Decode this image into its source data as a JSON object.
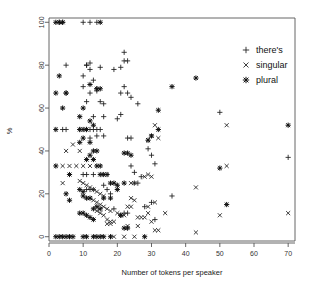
{
  "chart_data": {
    "type": "scatter",
    "title": "",
    "xlabel": "Number of tokens per speaker",
    "ylabel": "%",
    "xlim": [
      0,
      72
    ],
    "ylim": [
      -2,
      102
    ],
    "xticks": [
      0,
      10,
      20,
      30,
      40,
      50,
      60,
      70
    ],
    "yticks": [
      0,
      20,
      40,
      60,
      80,
      100
    ],
    "grid": false,
    "legend_position": "top-right",
    "series": [
      {
        "name": "there's",
        "marker": "plus",
        "points": [
          [
            3,
            100
          ],
          [
            4,
            100
          ],
          [
            10,
            100
          ],
          [
            12,
            100
          ],
          [
            14,
            100
          ],
          [
            22,
            86
          ],
          [
            23,
            82
          ],
          [
            22,
            82
          ],
          [
            21,
            79
          ],
          [
            15,
            79
          ],
          [
            12,
            81
          ],
          [
            11,
            80
          ],
          [
            5,
            80
          ],
          [
            11,
            80
          ],
          [
            12,
            78
          ],
          [
            19,
            78
          ],
          [
            10,
            75
          ],
          [
            13,
            73
          ],
          [
            22,
            70
          ],
          [
            10,
            70
          ],
          [
            12,
            67
          ],
          [
            5,
            67
          ],
          [
            21,
            67
          ],
          [
            14,
            69
          ],
          [
            23,
            67
          ],
          [
            24,
            65
          ],
          [
            14,
            68
          ],
          [
            11,
            63
          ],
          [
            15,
            63
          ],
          [
            26,
            62
          ],
          [
            16,
            62
          ],
          [
            21,
            57
          ],
          [
            20,
            55
          ],
          [
            13,
            56
          ],
          [
            16,
            56
          ],
          [
            5,
            50
          ],
          [
            9,
            50
          ],
          [
            11,
            50
          ],
          [
            12,
            50
          ],
          [
            13,
            50
          ],
          [
            14,
            50
          ],
          [
            15,
            50
          ],
          [
            4,
            50
          ],
          [
            14,
            47
          ],
          [
            16,
            47
          ],
          [
            12,
            46
          ],
          [
            23,
            46
          ],
          [
            24,
            46
          ],
          [
            29,
            41
          ],
          [
            30,
            38
          ],
          [
            31,
            34
          ],
          [
            10,
            29
          ],
          [
            11,
            29
          ],
          [
            13,
            29
          ],
          [
            24,
            33
          ],
          [
            25,
            30
          ],
          [
            27,
            28
          ],
          [
            26,
            25
          ],
          [
            25,
            25
          ],
          [
            36,
            19
          ],
          [
            18,
            20
          ],
          [
            17,
            22
          ],
          [
            16,
            24
          ],
          [
            13,
            22
          ],
          [
            12,
            22
          ],
          [
            11,
            22
          ],
          [
            28,
            14
          ],
          [
            30,
            16
          ],
          [
            22,
            11
          ],
          [
            21,
            10
          ],
          [
            50,
            58
          ],
          [
            70,
            37
          ],
          [
            23,
            11
          ],
          [
            31,
            8
          ],
          [
            19,
            13
          ]
        ]
      },
      {
        "name": "singular",
        "marker": "cross",
        "points": [
          [
            5,
            40
          ],
          [
            7,
            43
          ],
          [
            9,
            40
          ],
          [
            4,
            33
          ],
          [
            6,
            33
          ],
          [
            8,
            33
          ],
          [
            10,
            33
          ],
          [
            12,
            33
          ],
          [
            4,
            25
          ],
          [
            9,
            26
          ],
          [
            10,
            25
          ],
          [
            11,
            24
          ],
          [
            12,
            23
          ],
          [
            13,
            22
          ],
          [
            14,
            21
          ],
          [
            15,
            20
          ],
          [
            16,
            19
          ],
          [
            12,
            18
          ],
          [
            13,
            17
          ],
          [
            14,
            16
          ],
          [
            15,
            15
          ],
          [
            16,
            14
          ],
          [
            17,
            13
          ],
          [
            18,
            12
          ],
          [
            14,
            12
          ],
          [
            15,
            11
          ],
          [
            16,
            10
          ],
          [
            17,
            8
          ],
          [
            18,
            7
          ],
          [
            19,
            7
          ],
          [
            20,
            11
          ],
          [
            21,
            10
          ],
          [
            22,
            10
          ],
          [
            23,
            14
          ],
          [
            24,
            14
          ],
          [
            24,
            18
          ],
          [
            25,
            17
          ],
          [
            24,
            25
          ],
          [
            25,
            25
          ],
          [
            26,
            9
          ],
          [
            27,
            9
          ],
          [
            28,
            9
          ],
          [
            29,
            14
          ],
          [
            29,
            11
          ],
          [
            30,
            7
          ],
          [
            30,
            28
          ],
          [
            29,
            29
          ],
          [
            28,
            28
          ],
          [
            31,
            52
          ],
          [
            32,
            46
          ],
          [
            30,
            47
          ],
          [
            29,
            45
          ],
          [
            31,
            3
          ],
          [
            32,
            3
          ],
          [
            34,
            11
          ],
          [
            43,
            23
          ],
          [
            43,
            2
          ],
          [
            50,
            10
          ],
          [
            52,
            33
          ],
          [
            52,
            52
          ],
          [
            70,
            11
          ],
          [
            19,
            0
          ],
          [
            22,
            0
          ],
          [
            25,
            0
          ],
          [
            31,
            16
          ],
          [
            26,
            5
          ],
          [
            23,
            5
          ],
          [
            18,
            6
          ],
          [
            17,
            6
          ]
        ]
      },
      {
        "name": "plural",
        "marker": "asterisk",
        "points": [
          [
            2,
            100
          ],
          [
            3,
            100
          ],
          [
            4,
            100
          ],
          [
            15,
            100
          ],
          [
            3,
            75
          ],
          [
            2,
            67
          ],
          [
            5,
            67
          ],
          [
            4,
            60
          ],
          [
            10,
            60
          ],
          [
            2,
            50
          ],
          [
            9,
            50
          ],
          [
            10,
            50
          ],
          [
            9,
            56
          ],
          [
            12,
            54
          ],
          [
            13,
            52
          ],
          [
            11,
            50
          ],
          [
            10,
            46
          ],
          [
            12,
            44
          ],
          [
            9,
            44
          ],
          [
            13,
            40
          ],
          [
            14,
            40
          ],
          [
            12,
            38
          ],
          [
            13,
            36
          ],
          [
            11,
            36
          ],
          [
            14,
            33
          ],
          [
            15,
            33
          ],
          [
            6,
            29
          ],
          [
            2,
            33
          ],
          [
            5,
            20
          ],
          [
            6,
            17
          ],
          [
            9,
            22
          ],
          [
            10,
            21
          ],
          [
            10,
            19
          ],
          [
            11,
            18
          ],
          [
            12,
            18
          ],
          [
            13,
            13
          ],
          [
            14,
            14
          ],
          [
            15,
            13
          ],
          [
            16,
            18
          ],
          [
            9,
            11
          ],
          [
            10,
            11
          ],
          [
            11,
            10
          ],
          [
            12,
            9
          ],
          [
            13,
            8
          ],
          [
            18,
            25
          ],
          [
            19,
            25
          ],
          [
            20,
            24
          ],
          [
            22,
            39
          ],
          [
            23,
            39
          ],
          [
            24,
            38
          ],
          [
            15,
            29
          ],
          [
            16,
            29
          ],
          [
            17,
            29
          ],
          [
            18,
            18
          ],
          [
            20,
            22
          ],
          [
            22,
            25
          ],
          [
            22,
            4
          ],
          [
            23,
            4
          ],
          [
            29,
            45
          ],
          [
            30,
            47
          ],
          [
            32,
            50
          ],
          [
            32,
            59
          ],
          [
            36,
            70
          ],
          [
            43,
            74
          ],
          [
            50,
            32
          ],
          [
            52,
            15
          ],
          [
            70,
            52
          ],
          [
            14,
            69
          ],
          [
            12,
            71
          ],
          [
            15,
            69
          ],
          [
            2,
            0
          ],
          [
            3,
            0
          ],
          [
            4,
            0
          ],
          [
            5,
            0
          ],
          [
            6,
            0
          ],
          [
            7,
            0
          ],
          [
            10,
            0
          ],
          [
            11,
            0
          ],
          [
            13,
            0
          ],
          [
            14,
            0
          ],
          [
            15,
            0
          ],
          [
            16,
            0
          ],
          [
            28,
            0
          ],
          [
            18,
            0
          ],
          [
            21,
            10
          ]
        ]
      }
    ],
    "legend": [
      {
        "label": "there's",
        "marker": "plus"
      },
      {
        "label": "singular",
        "marker": "cross"
      },
      {
        "label": "plural",
        "marker": "asterisk"
      }
    ],
    "colors": {
      "marker": "#1c1c1c",
      "axis": "#555555",
      "background": "#ffffff",
      "text": "#222222"
    }
  }
}
